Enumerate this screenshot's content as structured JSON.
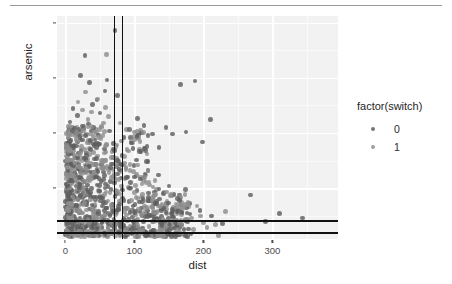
{
  "chart_data": {
    "type": "scatter",
    "title": "",
    "xlabel": "dist",
    "ylabel": "arsenic",
    "xlim": [
      -12,
      395
    ],
    "ylim": [
      0.2,
      10.3
    ],
    "xticks": [
      0,
      100,
      200,
      300
    ],
    "xtick_labels": [
      "0",
      "100",
      "200",
      "300"
    ],
    "yticks": [
      2.5,
      5.0,
      7.5,
      10.0
    ],
    "ytick_labels": [
      "2.5",
      "5.0",
      "7.5",
      "10.0"
    ],
    "grid": true,
    "legend": {
      "title": "factor(switch)",
      "position": "right",
      "entries": [
        {
          "label": "0",
          "color": "#5e5e5e"
        },
        {
          "label": "1",
          "color": "#8e8e8e"
        }
      ]
    },
    "annotations": [
      {
        "kind": "vline",
        "x": 70
      },
      {
        "kind": "vline",
        "x": 82
      },
      {
        "kind": "hline",
        "y": 1.05
      },
      {
        "kind": "hline",
        "y": 0.52
      }
    ],
    "series": [
      {
        "name": "0",
        "color": "#5e5e5e",
        "points": [
          [
            16.8,
            2.36
          ],
          [
            47.3,
            0.71
          ],
          [
            21.0,
            2.07
          ],
          [
            21.5,
            1.15
          ],
          [
            40.9,
            1.1
          ],
          [
            69.5,
            3.9
          ],
          [
            80.7,
            2.97
          ],
          [
            55.0,
            3.24
          ],
          [
            52.6,
            3.58
          ],
          [
            75.5,
            3.15
          ],
          [
            20.6,
            2.52
          ],
          [
            13.1,
            3.2
          ],
          [
            65.3,
            2.8
          ],
          [
            31.0,
            4.1
          ],
          [
            8.9,
            1.6
          ],
          [
            44.0,
            4.5
          ],
          [
            26.5,
            5.2
          ],
          [
            91.0,
            3.0
          ],
          [
            104.0,
            2.4
          ],
          [
            112.0,
            1.9
          ],
          [
            11.2,
            6.1
          ],
          [
            18.0,
            5.8
          ],
          [
            33.5,
            5.4
          ],
          [
            39.0,
            6.3
          ],
          [
            57.4,
            6.9
          ],
          [
            60.2,
            7.4
          ],
          [
            72.0,
            9.65
          ],
          [
            76.0,
            6.7
          ],
          [
            22.0,
            7.6
          ],
          [
            35.0,
            7.3
          ],
          [
            28.5,
            8.5
          ],
          [
            46.0,
            6.5
          ],
          [
            50.5,
            5.9
          ],
          [
            64.0,
            5.1
          ],
          [
            85.0,
            4.8
          ],
          [
            98.0,
            4.3
          ],
          [
            120.0,
            3.7
          ],
          [
            135.0,
            3.1
          ],
          [
            150.0,
            2.6
          ],
          [
            165.0,
            2.2
          ],
          [
            180.0,
            1.8
          ],
          [
            195.0,
            1.5
          ],
          [
            212.0,
            1.25
          ],
          [
            228.0,
            0.9
          ],
          [
            9.5,
            4.4
          ],
          [
            14.0,
            3.9
          ],
          [
            19.5,
            3.4
          ],
          [
            24.0,
            2.9
          ],
          [
            30.0,
            2.5
          ],
          [
            36.0,
            2.1
          ],
          [
            42.0,
            1.7
          ],
          [
            48.0,
            1.45
          ],
          [
            54.0,
            1.2
          ],
          [
            61.0,
            1.05
          ],
          [
            67.0,
            0.95
          ],
          [
            73.0,
            0.85
          ],
          [
            79.0,
            0.78
          ],
          [
            86.0,
            0.7
          ],
          [
            93.0,
            0.65
          ],
          [
            100.0,
            0.6
          ],
          [
            107.0,
            0.56
          ],
          [
            115.0,
            0.53
          ],
          [
            123.0,
            0.5
          ],
          [
            131.0,
            0.48
          ],
          [
            140.0,
            0.46
          ],
          [
            149.0,
            0.45
          ],
          [
            159.0,
            0.44
          ],
          [
            170.0,
            0.43
          ],
          [
            182.0,
            0.42
          ],
          [
            7.0,
            5.5
          ],
          [
            12.5,
            5.0
          ],
          [
            17.5,
            4.6
          ],
          [
            23.0,
            4.2
          ],
          [
            29.0,
            3.8
          ],
          [
            34.5,
            3.5
          ],
          [
            41.0,
            3.2
          ],
          [
            49.0,
            2.95
          ],
          [
            58.0,
            2.7
          ],
          [
            66.0,
            2.45
          ],
          [
            74.0,
            2.25
          ],
          [
            83.0,
            2.05
          ],
          [
            92.0,
            1.9
          ],
          [
            101.0,
            1.75
          ],
          [
            110.0,
            1.6
          ],
          [
            119.0,
            1.48
          ],
          [
            129.0,
            1.35
          ],
          [
            139.0,
            1.22
          ],
          [
            149.5,
            1.12
          ],
          [
            161.0,
            1.0
          ],
          [
            6.0,
            3.0
          ],
          [
            10.5,
            2.8
          ],
          [
            15.5,
            2.6
          ],
          [
            20.0,
            2.4
          ],
          [
            25.5,
            2.3
          ],
          [
            31.5,
            2.2
          ],
          [
            37.5,
            2.1
          ],
          [
            43.5,
            2.0
          ],
          [
            51.0,
            1.92
          ],
          [
            59.0,
            1.84
          ],
          [
            68.0,
            1.76
          ],
          [
            77.0,
            1.68
          ],
          [
            87.0,
            1.6
          ],
          [
            97.0,
            1.52
          ],
          [
            108.0,
            1.44
          ],
          [
            118.0,
            1.36
          ],
          [
            128.0,
            1.28
          ],
          [
            8.0,
            1.0
          ],
          [
            13.0,
            0.95
          ],
          [
            18.5,
            0.9
          ],
          [
            24.5,
            0.86
          ],
          [
            32.0,
            0.82
          ],
          [
            38.5,
            0.79
          ],
          [
            45.0,
            0.76
          ],
          [
            53.0,
            0.73
          ],
          [
            62.0,
            0.7
          ],
          [
            71.0,
            0.68
          ],
          [
            81.0,
            0.66
          ],
          [
            90.0,
            0.64
          ],
          [
            210.0,
            5.6
          ],
          [
            268.0,
            2.2
          ],
          [
            290.0,
            1.0
          ],
          [
            310.0,
            1.35
          ],
          [
            344.0,
            1.15
          ],
          [
            188.0,
            7.35
          ],
          [
            167.0,
            7.2
          ],
          [
            175.0,
            5.05
          ],
          [
            199.0,
            4.6
          ],
          [
            146.0,
            5.25
          ],
          [
            155.0,
            4.95
          ],
          [
            136.0,
            4.35
          ],
          [
            126.0,
            4.95
          ],
          [
            114.0,
            5.35
          ],
          [
            105.0,
            5.65
          ]
        ]
      },
      {
        "name": "1",
        "color": "#8e8e8e",
        "points": [
          [
            5.5,
            4.0
          ],
          [
            11.0,
            4.3
          ],
          [
            16.0,
            4.7
          ],
          [
            22.5,
            4.9
          ],
          [
            27.0,
            5.3
          ],
          [
            33.0,
            5.6
          ],
          [
            38.0,
            5.95
          ],
          [
            44.5,
            5.15
          ],
          [
            52.0,
            4.75
          ],
          [
            59.5,
            4.45
          ],
          [
            67.5,
            4.15
          ],
          [
            75.0,
            3.85
          ],
          [
            84.0,
            3.55
          ],
          [
            94.0,
            3.3
          ],
          [
            103.0,
            3.05
          ],
          [
            113.0,
            2.85
          ],
          [
            122.0,
            2.65
          ],
          [
            132.0,
            2.45
          ],
          [
            143.0,
            2.3
          ],
          [
            154.0,
            2.15
          ],
          [
            166.0,
            2.0
          ],
          [
            178.0,
            1.85
          ],
          [
            191.0,
            1.7
          ],
          [
            6.5,
            2.2
          ],
          [
            12.0,
            2.35
          ],
          [
            17.0,
            2.5
          ],
          [
            23.5,
            2.65
          ],
          [
            28.0,
            2.8
          ],
          [
            34.0,
            2.95
          ],
          [
            39.5,
            3.1
          ],
          [
            45.5,
            3.25
          ],
          [
            53.5,
            3.4
          ],
          [
            60.5,
            3.5
          ],
          [
            69.0,
            3.6
          ],
          [
            78.0,
            3.7
          ],
          [
            88.0,
            3.45
          ],
          [
            99.0,
            3.25
          ],
          [
            109.0,
            3.0
          ],
          [
            117.0,
            2.75
          ],
          [
            127.0,
            2.55
          ],
          [
            7.5,
            1.5
          ],
          [
            13.5,
            1.6
          ],
          [
            19.0,
            1.7
          ],
          [
            25.0,
            1.8
          ],
          [
            30.5,
            1.9
          ],
          [
            36.5,
            1.98
          ],
          [
            42.5,
            2.06
          ],
          [
            50.0,
            2.14
          ],
          [
            57.0,
            2.22
          ],
          [
            65.0,
            2.3
          ],
          [
            72.5,
            2.38
          ],
          [
            82.0,
            2.46
          ],
          [
            91.5,
            2.54
          ],
          [
            102.0,
            2.62
          ],
          [
            111.0,
            2.7
          ],
          [
            121.0,
            2.78
          ],
          [
            130.0,
            2.86
          ],
          [
            9.0,
            0.9
          ],
          [
            14.5,
            0.95
          ],
          [
            20.5,
            1.0
          ],
          [
            26.0,
            1.05
          ],
          [
            32.5,
            1.1
          ],
          [
            37.0,
            1.15
          ],
          [
            43.0,
            1.2
          ],
          [
            51.5,
            1.25
          ],
          [
            58.5,
            1.3
          ],
          [
            66.5,
            1.35
          ],
          [
            74.5,
            1.4
          ],
          [
            85.5,
            1.45
          ],
          [
            95.0,
            1.5
          ],
          [
            106.0,
            1.55
          ],
          [
            116.0,
            1.6
          ],
          [
            125.0,
            1.65
          ],
          [
            134.0,
            1.7
          ],
          [
            10.0,
            0.62
          ],
          [
            15.0,
            0.6
          ],
          [
            21.8,
            0.58
          ],
          [
            27.5,
            0.57
          ],
          [
            33.8,
            0.56
          ],
          [
            40.0,
            0.55
          ],
          [
            47.5,
            0.54
          ],
          [
            56.0,
            0.53
          ],
          [
            63.5,
            0.52
          ],
          [
            70.5,
            0.51
          ],
          [
            80.0,
            0.5
          ],
          [
            89.0,
            0.49
          ],
          [
            96.5,
            0.48
          ],
          [
            104.5,
            0.47
          ],
          [
            112.5,
            0.46
          ],
          [
            124.0,
            0.45
          ],
          [
            137.0,
            0.44
          ],
          [
            145.0,
            0.43
          ],
          [
            157.0,
            0.42
          ],
          [
            172.0,
            0.41
          ],
          [
            186.0,
            0.62
          ],
          [
            205.0,
            0.72
          ],
          [
            222.0,
            0.35
          ],
          [
            152.0,
            0.95
          ],
          [
            162.0,
            0.85
          ],
          [
            142.0,
            1.05
          ],
          [
            177.0,
            1.1
          ],
          [
            196.0,
            1.25
          ],
          [
            232.0,
            1.45
          ],
          [
            60.0,
            8.55
          ],
          [
            58.0,
            6.15
          ],
          [
            46.5,
            6.55
          ],
          [
            18.2,
            6.4
          ],
          [
            24.8,
            6.05
          ],
          [
            29.5,
            6.85
          ],
          [
            55.5,
            5.45
          ],
          [
            63.0,
            5.75
          ],
          [
            88.5,
            5.15
          ],
          [
            79.5,
            5.45
          ],
          [
            97.5,
            4.55
          ],
          [
            107.5,
            4.25
          ],
          [
            118.5,
            4.05
          ],
          [
            40.5,
            4.85
          ],
          [
            34.8,
            4.55
          ],
          [
            28.2,
            4.25
          ],
          [
            21.2,
            3.95
          ],
          [
            15.2,
            3.65
          ],
          [
            9.8,
            3.45
          ],
          [
            6.8,
            3.25
          ],
          [
            47.0,
            3.95
          ],
          [
            54.5,
            3.75
          ],
          [
            62.5,
            3.35
          ],
          [
            71.5,
            3.15
          ],
          [
            86.5,
            2.95
          ],
          [
            93.5,
            2.5
          ],
          [
            100.5,
            2.3
          ],
          [
            110.5,
            2.1
          ],
          [
            119.5,
            1.95
          ],
          [
            128.5,
            1.8
          ],
          [
            138.5,
            1.65
          ],
          [
            147.0,
            1.55
          ],
          [
            156.0,
            1.4
          ],
          [
            168.0,
            1.3
          ],
          [
            183.0,
            1.15
          ],
          [
            200.0,
            0.95
          ],
          [
            218.0,
            0.85
          ]
        ]
      }
    ]
  }
}
